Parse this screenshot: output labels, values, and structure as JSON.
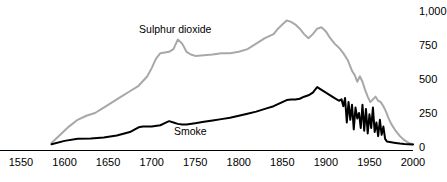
{
  "chart_data": {
    "type": "line",
    "title": "",
    "subtitle": "",
    "xlabel": "",
    "ylabel": "",
    "xlim": [
      1550,
      2000
    ],
    "ylim": [
      0,
      1000
    ],
    "grid": false,
    "legend_position": "inline-annotation",
    "x_ticks": [
      "1550",
      "1600",
      "1650",
      "1700",
      "1750",
      "1800",
      "1850",
      "1900",
      "1950",
      "2000"
    ],
    "x_tick_values": [
      1550,
      1600,
      1650,
      1700,
      1750,
      1800,
      1850,
      1900,
      1950,
      2000
    ],
    "y_ticks": [
      "0",
      "250",
      "500",
      "750",
      "1,000"
    ],
    "y_tick_values": [
      0,
      250,
      500,
      750,
      1000
    ],
    "y_axis_side": "right",
    "annotations": [
      {
        "text": "Sulphur dioxide",
        "x": 1720,
        "y": 860
      },
      {
        "text": "Smoke",
        "x": 1760,
        "y": 110
      }
    ],
    "series": [
      {
        "name": "Sulphur dioxide",
        "color": "#a8a8a8",
        "width": 2,
        "x": [
          1585,
          1595,
          1605,
          1615,
          1625,
          1635,
          1645,
          1655,
          1665,
          1675,
          1685,
          1695,
          1700,
          1705,
          1710,
          1715,
          1720,
          1725,
          1730,
          1735,
          1740,
          1745,
          1750,
          1760,
          1770,
          1780,
          1790,
          1800,
          1810,
          1820,
          1830,
          1840,
          1845,
          1850,
          1855,
          1860,
          1865,
          1870,
          1875,
          1880,
          1885,
          1890,
          1895,
          1900,
          1905,
          1910,
          1915,
          1920,
          1925,
          1930,
          1933,
          1936,
          1939,
          1942,
          1945,
          1948,
          1951,
          1954,
          1957,
          1960,
          1963,
          1966,
          1969,
          1972,
          1975,
          1980,
          1985,
          1990,
          1995,
          2000
        ],
        "y": [
          30,
          90,
          150,
          200,
          230,
          250,
          290,
          330,
          370,
          410,
          450,
          520,
          580,
          650,
          690,
          695,
          700,
          720,
          790,
          760,
          700,
          680,
          670,
          675,
          680,
          690,
          690,
          700,
          720,
          760,
          800,
          830,
          870,
          900,
          930,
          920,
          900,
          870,
          830,
          800,
          830,
          870,
          880,
          850,
          800,
          760,
          730,
          690,
          640,
          560,
          530,
          480,
          520,
          480,
          420,
          370,
          330,
          350,
          370,
          340,
          330,
          300,
          260,
          210,
          170,
          120,
          80,
          50,
          30,
          20
        ]
      },
      {
        "name": "Smoke",
        "color": "#000000",
        "width": 2,
        "x": [
          1585,
          1600,
          1615,
          1630,
          1645,
          1660,
          1675,
          1685,
          1690,
          1695,
          1700,
          1710,
          1715,
          1720,
          1725,
          1730,
          1735,
          1740,
          1750,
          1760,
          1770,
          1780,
          1790,
          1800,
          1810,
          1820,
          1830,
          1840,
          1850,
          1855,
          1860,
          1865,
          1870,
          1875,
          1880,
          1885,
          1890,
          1895,
          1900,
          1905,
          1910,
          1915,
          1918,
          1920,
          1922,
          1924,
          1926,
          1928,
          1930,
          1932,
          1934,
          1936,
          1938,
          1940,
          1942,
          1944,
          1946,
          1948,
          1950,
          1952,
          1954,
          1956,
          1958,
          1960,
          1962,
          1964,
          1966,
          1968,
          1970,
          1975,
          1980,
          1985,
          1990,
          1995,
          2000
        ],
        "y": [
          20,
          45,
          60,
          62,
          70,
          85,
          110,
          145,
          150,
          150,
          150,
          160,
          175,
          190,
          180,
          170,
          165,
          165,
          175,
          185,
          195,
          205,
          215,
          230,
          245,
          260,
          280,
          300,
          330,
          345,
          350,
          350,
          355,
          370,
          380,
          400,
          440,
          420,
          400,
          380,
          360,
          340,
          350,
          300,
          360,
          180,
          330,
          200,
          310,
          130,
          290,
          210,
          250,
          140,
          310,
          120,
          280,
          100,
          240,
          140,
          290,
          110,
          180,
          80,
          200,
          90,
          150,
          60,
          40,
          35,
          30,
          25,
          22,
          20,
          18
        ]
      }
    ]
  },
  "axes": {
    "x_axis_name": "year-axis",
    "y_axis_name": "concentration-axis"
  }
}
